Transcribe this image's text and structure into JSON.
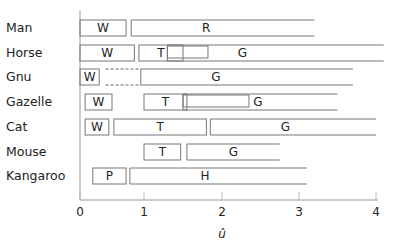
{
  "chart_data": {
    "type": "gantt",
    "title": "",
    "xlabel": "û",
    "ylabel": "",
    "xlim": [
      0,
      4
    ],
    "xticks": [
      "0",
      "1",
      "2",
      "3",
      "4"
    ],
    "rows": [
      {
        "name": "Man",
        "segments": [
          {
            "label": "W",
            "start": 0.0,
            "end": 0.72
          },
          {
            "label": "R",
            "start": 0.8,
            "end": 3.2,
            "open": true
          }
        ]
      },
      {
        "name": "Horse",
        "segments": [
          {
            "label": "W",
            "start": 0.0,
            "end": 0.85
          },
          {
            "label": "T",
            "start": 0.92,
            "end": 1.5
          },
          {
            "label": "",
            "start": 1.3,
            "end": 1.82,
            "inner": true
          },
          {
            "label": "G",
            "start": 1.3,
            "end": 4.1,
            "open": true
          }
        ]
      },
      {
        "name": "Gnu",
        "segments": [
          {
            "label": "W",
            "start": 0.0,
            "end": 0.3
          },
          {
            "label": "",
            "start": 0.4,
            "end": 0.95,
            "dashed": true
          },
          {
            "label": "G",
            "start": 0.95,
            "end": 3.7,
            "open": true
          }
        ]
      },
      {
        "name": "Gazelle",
        "segments": [
          {
            "label": "W",
            "start": 0.08,
            "end": 0.5
          },
          {
            "label": "T",
            "start": 1.0,
            "end": 1.55
          },
          {
            "label": "",
            "start": 1.5,
            "end": 2.35,
            "inner": true
          },
          {
            "label": "G",
            "start": 1.5,
            "end": 3.5,
            "open": true
          }
        ]
      },
      {
        "name": "Cat",
        "segments": [
          {
            "label": "W",
            "start": 0.08,
            "end": 0.45
          },
          {
            "label": "T",
            "start": 0.53,
            "end": 1.8
          },
          {
            "label": "G",
            "start": 1.85,
            "end": 4.0,
            "open": true
          }
        ]
      },
      {
        "name": "Mouse",
        "segments": [
          {
            "label": "T",
            "start": 1.0,
            "end": 1.47
          },
          {
            "label": "G",
            "start": 1.55,
            "end": 2.75,
            "open": true
          }
        ]
      },
      {
        "name": "Kangaroo",
        "segments": [
          {
            "label": "P",
            "start": 0.2,
            "end": 0.72
          },
          {
            "label": "H",
            "start": 0.78,
            "end": 3.1,
            "open": true
          }
        ]
      }
    ]
  }
}
